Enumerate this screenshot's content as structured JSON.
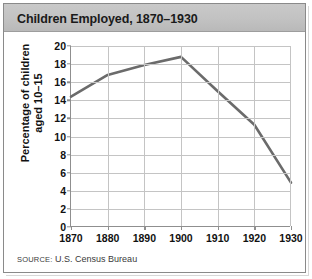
{
  "title": "Children Employed, 1870–1930",
  "source": {
    "label": "SOURCE:",
    "text": "U.S. Census Bureau"
  },
  "colors": {
    "line": "#6b6b6b",
    "grid": "#c4c4c4",
    "axis": "#8f8f8f",
    "title_bar": "#c2c2c2",
    "frame": "#8a8a8a",
    "text": "#111111"
  },
  "chart_data": {
    "type": "line",
    "title": "Children Employed, 1870–1930",
    "xlabel": "",
    "ylabel": "Percentage of children aged 10–15",
    "ylabel_line1": "Percentage of children",
    "ylabel_line2": "aged 10–15",
    "x": [
      1870,
      1880,
      1890,
      1900,
      1910,
      1920,
      1930
    ],
    "values": [
      14.4,
      16.8,
      17.9,
      18.8,
      15.0,
      11.3,
      4.9
    ],
    "categories": [
      "1870",
      "1880",
      "1890",
      "1900",
      "1910",
      "1920",
      "1930"
    ],
    "xlim": [
      1870,
      1930
    ],
    "ylim": [
      0,
      20
    ],
    "yticks": [
      0,
      2,
      4,
      6,
      8,
      10,
      12,
      14,
      16,
      18,
      20
    ],
    "ytick_labels": [
      "0",
      "2",
      "4",
      "6",
      "8",
      "10",
      "12",
      "14",
      "16",
      "18",
      "20"
    ],
    "xticks": [
      1870,
      1880,
      1890,
      1900,
      1910,
      1920,
      1930
    ],
    "xtick_labels": [
      "1870",
      "1880",
      "1890",
      "1900",
      "1910",
      "1920",
      "1930"
    ],
    "grid": true,
    "legend": false,
    "series": [
      {
        "name": "Percentage of children aged 10–15 employed",
        "values": [
          14.4,
          16.8,
          17.9,
          18.8,
          15.0,
          11.3,
          4.9
        ]
      }
    ]
  }
}
